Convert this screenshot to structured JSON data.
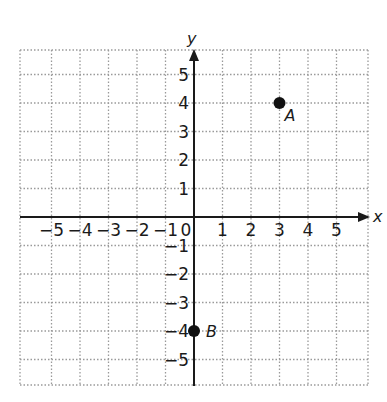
{
  "chart_data": {
    "type": "scatter",
    "title": "",
    "xlabel": "x",
    "ylabel": "y",
    "xlim": [
      -5,
      5
    ],
    "ylim": [
      -5,
      5
    ],
    "grid": true,
    "grid_style": "dotted",
    "x_ticks": [
      "−5",
      "−4",
      "−3",
      "−2",
      "−1",
      "0",
      "1",
      "2",
      "3",
      "4",
      "5"
    ],
    "y_ticks": [
      "5",
      "4",
      "3",
      "2",
      "1",
      "−1",
      "−2",
      "−3",
      "−4",
      "−5"
    ],
    "origin_label": "0",
    "points": [
      {
        "label": "A",
        "x": 3,
        "y": 4
      },
      {
        "label": "B",
        "x": 0,
        "y": -4
      }
    ],
    "colors": {
      "axis": "#1a1a1a",
      "grid": "#9a9a9a",
      "point": "#111111"
    }
  }
}
